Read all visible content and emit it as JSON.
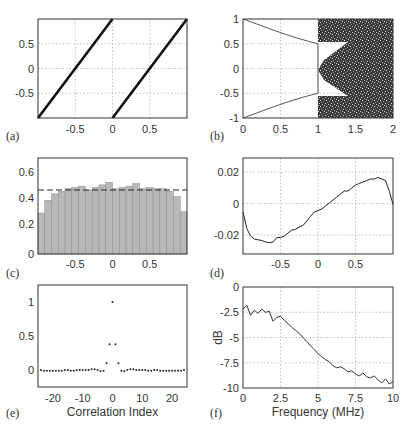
{
  "chart_data": [
    {
      "panel": "(a)",
      "type": "line",
      "title": "",
      "xlabel": "",
      "ylabel": "",
      "xlim": [
        -1,
        1
      ],
      "ylim": [
        -1,
        1
      ],
      "xticks": [
        "-0.5",
        "0",
        "0.5"
      ],
      "yticks": [
        "-0.5",
        "0",
        "0.5"
      ],
      "grid": true,
      "series": [
        {
          "name": "segment-1",
          "x": [
            -1,
            0
          ],
          "y": [
            -1,
            1
          ]
        },
        {
          "name": "segment-2",
          "x": [
            0,
            1
          ],
          "y": [
            -1,
            1
          ]
        }
      ]
    },
    {
      "panel": "(b)",
      "type": "scatter",
      "title": "",
      "xlabel": "",
      "ylabel": "",
      "xlim": [
        0,
        2
      ],
      "ylim": [
        -1,
        1
      ],
      "xticks": [
        "0",
        "0.5",
        "1",
        "1.5",
        "2"
      ],
      "yticks": [
        "-1",
        "-0.5",
        "0",
        "0.5",
        "1"
      ],
      "grid": true,
      "description": "Bifurcation-like diagram: thin upper branch from (0,1) to (1,0.5), lower branch from (0,-1) to (1,-0.5); dense chaotic region for x>1 spanning -1..1 with wedge-shaped gaps near ±0.4 until x≈1.4",
      "series": [
        {
          "name": "upper-branch",
          "x": [
            0,
            0.25,
            0.5,
            0.75,
            1.0
          ],
          "y": [
            1.0,
            0.82,
            0.69,
            0.58,
            0.5
          ]
        },
        {
          "name": "lower-branch",
          "x": [
            0,
            0.25,
            0.5,
            0.75,
            1.0
          ],
          "y": [
            -1.0,
            -0.82,
            -0.69,
            -0.58,
            -0.5
          ]
        }
      ]
    },
    {
      "panel": "(c)",
      "type": "bar",
      "title": "",
      "xlabel": "",
      "ylabel": "",
      "xlim": [
        -1,
        1
      ],
      "ylim": [
        0,
        0.75
      ],
      "xticks": [
        "-0.5",
        "0",
        "0.5"
      ],
      "yticks": [
        "0",
        "0.2",
        "0.4",
        "0.6"
      ],
      "grid": false,
      "reference_line": {
        "y": 0.5,
        "style": "dashed"
      },
      "bin_edges_start": -1,
      "bin_width": 0.0909,
      "values": [
        0.32,
        0.42,
        0.47,
        0.49,
        0.51,
        0.52,
        0.53,
        0.5,
        0.52,
        0.54,
        0.56,
        0.51,
        0.52,
        0.53,
        0.55,
        0.51,
        0.52,
        0.51,
        0.51,
        0.49,
        0.45,
        0.33
      ]
    },
    {
      "panel": "(d)",
      "type": "line",
      "title": "",
      "xlabel": "",
      "ylabel": "",
      "xlim": [
        -1,
        1
      ],
      "ylim": [
        -0.032,
        0.032
      ],
      "xticks": [
        "-0.5",
        "0",
        "0.5"
      ],
      "yticks": [
        "-0.02",
        "0",
        "0.02"
      ],
      "grid": true,
      "x": [
        -1.0,
        -0.95,
        -0.9,
        -0.85,
        -0.8,
        -0.75,
        -0.7,
        -0.65,
        -0.6,
        -0.55,
        -0.5,
        -0.45,
        -0.4,
        -0.35,
        -0.3,
        -0.25,
        -0.2,
        -0.15,
        -0.1,
        -0.05,
        0.0,
        0.05,
        0.1,
        0.15,
        0.2,
        0.25,
        0.3,
        0.35,
        0.4,
        0.45,
        0.5,
        0.55,
        0.6,
        0.65,
        0.7,
        0.75,
        0.8,
        0.85,
        0.9,
        0.95,
        1.0
      ],
      "y": [
        -0.004,
        -0.015,
        -0.02,
        -0.022,
        -0.0225,
        -0.023,
        -0.024,
        -0.0245,
        -0.024,
        -0.021,
        -0.021,
        -0.02,
        -0.018,
        -0.016,
        -0.0155,
        -0.014,
        -0.013,
        -0.01,
        -0.007,
        -0.004,
        -0.003,
        -0.002,
        0.0,
        0.002,
        0.004,
        0.006,
        0.008,
        0.01,
        0.01,
        0.012,
        0.014,
        0.015,
        0.016,
        0.017,
        0.018,
        0.018,
        0.019,
        0.018,
        0.017,
        0.01,
        0.001
      ]
    },
    {
      "panel": "(e)",
      "type": "scatter",
      "title": "",
      "xlabel": "Correlation Index",
      "ylabel": "",
      "xlim": [
        -25,
        25
      ],
      "ylim": [
        -0.25,
        1.25
      ],
      "xticks": [
        "-20",
        "-10",
        "0",
        "10",
        "20"
      ],
      "yticks": [
        "0",
        "0.5",
        "1"
      ],
      "grid": false,
      "x": [
        -24,
        -23,
        -22,
        -21,
        -20,
        -19,
        -18,
        -17,
        -16,
        -15,
        -14,
        -13,
        -12,
        -11,
        -10,
        -9,
        -8,
        -7,
        -6,
        -5,
        -4,
        -3,
        -2,
        -1,
        0,
        1,
        2,
        3,
        4,
        5,
        6,
        7,
        8,
        9,
        10,
        11,
        12,
        13,
        14,
        15,
        16,
        17,
        18,
        19,
        20,
        21,
        22,
        23,
        24
      ],
      "y": [
        0.0,
        -0.01,
        -0.01,
        -0.01,
        -0.01,
        -0.01,
        -0.01,
        -0.01,
        0.0,
        0.0,
        -0.01,
        -0.01,
        0.0,
        0.0,
        0.0,
        0.0,
        0.0,
        0.01,
        0.01,
        0.0,
        -0.02,
        -0.01,
        0.1,
        0.38,
        1.0,
        0.38,
        0.1,
        -0.01,
        -0.02,
        0.0,
        0.01,
        0.01,
        0.0,
        0.0,
        0.0,
        0.0,
        -0.01,
        -0.01,
        0.0,
        0.0,
        -0.01,
        -0.01,
        -0.01,
        -0.01,
        -0.01,
        -0.01,
        -0.01,
        -0.01,
        0.0
      ]
    },
    {
      "panel": "(f)",
      "type": "line",
      "title": "",
      "xlabel": "Frequency (MHz)",
      "ylabel": "dB",
      "xlim": [
        0,
        10
      ],
      "ylim": [
        -10,
        0
      ],
      "xticks": [
        "0",
        "2.5",
        "5",
        "7.5",
        "10"
      ],
      "yticks": [
        "-10",
        "-7.5",
        "-5",
        "-2.5",
        "0"
      ],
      "grid": true,
      "x": [
        0.0,
        0.25,
        0.5,
        0.75,
        1.0,
        1.25,
        1.5,
        1.75,
        2.0,
        2.25,
        2.5,
        2.75,
        3.0,
        3.25,
        3.5,
        3.75,
        4.0,
        4.25,
        4.5,
        4.75,
        5.0,
        5.25,
        5.5,
        5.75,
        6.0,
        6.25,
        6.5,
        6.75,
        7.0,
        7.25,
        7.5,
        7.75,
        8.0,
        8.25,
        8.5,
        8.75,
        9.0,
        9.25,
        9.5,
        9.75,
        10.0
      ],
      "y": [
        -2.2,
        -1.8,
        -2.8,
        -2.3,
        -2.6,
        -2.2,
        -2.5,
        -2.4,
        -3.4,
        -3.0,
        -2.9,
        -3.3,
        -3.6,
        -4.0,
        -4.3,
        -4.6,
        -5.0,
        -5.4,
        -5.8,
        -6.2,
        -6.6,
        -6.9,
        -7.2,
        -7.4,
        -7.8,
        -8.0,
        -7.9,
        -8.1,
        -8.4,
        -8.3,
        -8.6,
        -8.8,
        -8.5,
        -8.9,
        -9.0,
        -8.8,
        -9.2,
        -9.5,
        -9.1,
        -9.6,
        -9.4
      ]
    }
  ],
  "panels": {
    "a": {
      "label": "(a)",
      "xticks": [
        "-0.5",
        "0",
        "0.5"
      ],
      "yticks": [
        "0.5",
        "0",
        "-0.5"
      ]
    },
    "b": {
      "label": "(b)",
      "xticks": [
        "0",
        "0.5",
        "1",
        "1.5",
        "2"
      ],
      "yticks": [
        "1",
        "0.5",
        "0",
        "-0.5",
        "-1"
      ]
    },
    "c": {
      "label": "(c)",
      "xticks": [
        "-0.5",
        "0",
        "0.5"
      ],
      "yticks": [
        "0.6",
        "0.4",
        "0.2",
        "0"
      ]
    },
    "d": {
      "label": "(d)",
      "xticks": [
        "-0.5",
        "0",
        "0.5"
      ],
      "yticks": [
        "0.02",
        "0",
        "-0.02"
      ]
    },
    "e": {
      "label": "(e)",
      "xticks": [
        "-20",
        "-10",
        "0",
        "10",
        "20"
      ],
      "yticks": [
        "1",
        "0.5",
        "0"
      ],
      "xlabel": "Correlation Index"
    },
    "f": {
      "label": "(f)",
      "xticks": [
        "0",
        "2.5",
        "5",
        "7.5",
        "10"
      ],
      "yticks": [
        "0",
        "-2.5",
        "-5",
        "-7.5",
        "-10"
      ],
      "xlabel": "Frequency (MHz)",
      "ylabel": "dB"
    }
  },
  "colors": {
    "axis": "#222222",
    "grid": "#aaaaaa",
    "bar": "#b8b8b8",
    "bar_edge": "#8a8a8a",
    "line": "#1a1a1a"
  }
}
